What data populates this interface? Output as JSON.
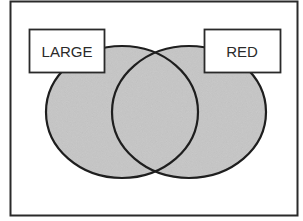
{
  "diagram": {
    "type": "venn",
    "sets": [
      {
        "label": "LARGE",
        "fill": "#c8c8c8"
      },
      {
        "label": "RED",
        "fill": "#c8c8c8"
      }
    ],
    "stroke_color": "#1e1e1e",
    "frame_color": "#2a2a2a"
  }
}
